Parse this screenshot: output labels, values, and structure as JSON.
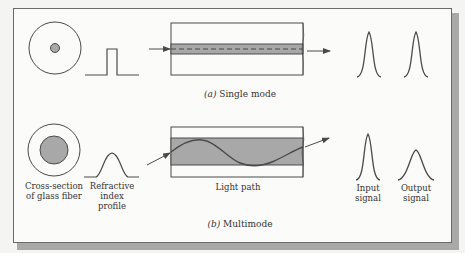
{
  "figure": {
    "panels": [
      {
        "id": "a",
        "caption_letter": "(a)",
        "caption_text": "Single mode",
        "components": {
          "cross_section": "small-core-fiber",
          "index_profile": "step",
          "light_path": "straight-axial",
          "input_signal": "narrow-pulse",
          "output_signal": "narrow-pulse"
        }
      },
      {
        "id": "b",
        "caption_letter": "(b)",
        "caption_text": "Multimode",
        "components": {
          "cross_section": "large-core-fiber",
          "index_profile": "graded",
          "light_path": "sinusoidal",
          "input_signal": "narrow-pulse",
          "output_signal": "broadened-pulse"
        }
      }
    ],
    "labels": {
      "cross_section_line1": "Cross-section",
      "cross_section_line2": "of glass fiber",
      "refractive_line1": "Refractive",
      "refractive_line2": "index",
      "refractive_line3": "profile",
      "light_path": "Light path",
      "input_line1": "Input",
      "input_line2": "signal",
      "output_line1": "Output",
      "output_line2": "signal"
    },
    "colors": {
      "line": "#4a4a4a",
      "core_fill": "#a8a8a8",
      "background": "#fbfbf9",
      "shadow": "#a9a9a7"
    }
  }
}
